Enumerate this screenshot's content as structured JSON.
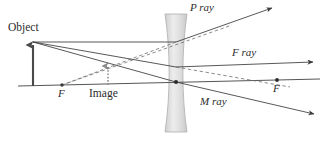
{
  "diagram": {
    "labels": {
      "object": "Object",
      "image": "Image",
      "focal_left": "F",
      "focal_right": "F",
      "p_ray": "P ray",
      "f_ray": "F ray",
      "m_ray": "M ray"
    },
    "colors": {
      "ink": "#3a3a3a",
      "ink_dark": "#2b2b2b",
      "lens_fill": "#d8d8d8",
      "lens_stroke": "#b0b0b0",
      "dashed": "#6e6e6e",
      "axis": "#555555"
    },
    "geometry": {
      "axis": {
        "x1": 18,
        "y1": 86,
        "x2": 320,
        "y2": 79
      },
      "object_arrow": {
        "x": 33,
        "y_base": 86,
        "y_tip": 42
      },
      "image_arrow": {
        "x": 108,
        "y_base": 85,
        "y_tip": 63
      },
      "lens": {
        "cx": 176,
        "y_top": 14,
        "y_bottom": 132,
        "half_width_end": 11,
        "half_width_waist": 3.5
      },
      "focal_left": {
        "x": 62,
        "y": 85
      },
      "focal_right": {
        "x": 277,
        "y": 80
      },
      "lens_center": {
        "x": 176,
        "y": 82
      },
      "p_ray_exit": {
        "x": 272,
        "y": 8
      },
      "f_ray_exit": {
        "x": 313,
        "y": 62
      },
      "m_ray_exit": {
        "x": 314,
        "y": 114
      }
    },
    "label_positions": {
      "object": {
        "left": 8,
        "top": 22
      },
      "image": {
        "left": 89,
        "top": 88
      },
      "focal_left": {
        "left": 58,
        "top": 88
      },
      "focal_right": {
        "left": 273,
        "top": 83
      },
      "p_ray": {
        "left": 190,
        "top": 2
      },
      "f_ray": {
        "left": 232,
        "top": 47
      },
      "m_ray": {
        "left": 200,
        "top": 96
      }
    }
  }
}
